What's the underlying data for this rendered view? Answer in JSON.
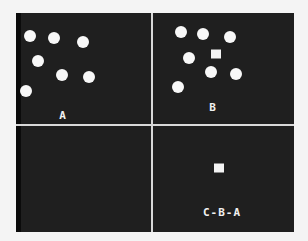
{
  "panels": {
    "A": {
      "label": "A",
      "label_pos": [
        63,
        115
      ],
      "dots": [
        [
          30,
          36
        ],
        [
          54,
          38
        ],
        [
          83,
          42
        ],
        [
          38,
          61
        ],
        [
          62,
          75
        ],
        [
          89,
          77
        ],
        [
          26,
          91
        ]
      ],
      "squares": []
    },
    "B": {
      "label": "B",
      "label_pos": [
        213,
        107
      ],
      "dots": [
        [
          181,
          32
        ],
        [
          203,
          34
        ],
        [
          230,
          37
        ],
        [
          189,
          58
        ],
        [
          211,
          72
        ],
        [
          236,
          74
        ],
        [
          178,
          87
        ]
      ],
      "squares": [
        [
          216,
          54
        ]
      ]
    },
    "empty": {
      "label": "",
      "dots": [],
      "squares": []
    },
    "C": {
      "label": "C-B-A",
      "label_pos": [
        222,
        212
      ],
      "dots": [],
      "squares": [
        [
          219,
          168
        ]
      ]
    }
  },
  "colors": {
    "background": "#1f1f1f",
    "foreground": "#f8f8f8",
    "page": "#f4f4f4",
    "divider": "#d8d8d8"
  }
}
